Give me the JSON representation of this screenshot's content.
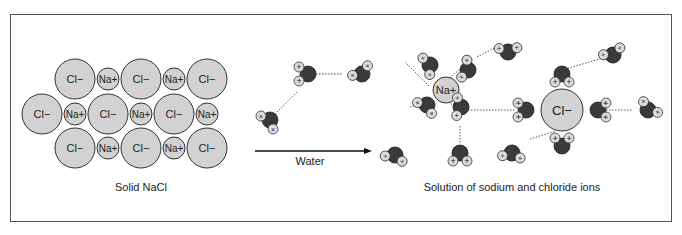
{
  "figure": {
    "panels": {
      "solid": {
        "caption": "Solid NaCl",
        "anion_label": "Cl−",
        "cation_label": "Na+"
      },
      "water": {
        "arrow_label": "Water"
      },
      "solution": {
        "caption": "Solution of sodium and chloride ions",
        "sodium_label": "Na+",
        "chloride_label": "Cl−"
      }
    },
    "colors": {
      "ion_fill": "#d2d2d2",
      "oxygen_fill": "#3a3a3a",
      "hydrogen_fill": "#dcdcdc",
      "stroke": "#333333",
      "frame": "#555555"
    },
    "symbols": {
      "partial_positive": "+",
      "partial_negative": "−",
      "hydrogen_marker": "×"
    }
  }
}
